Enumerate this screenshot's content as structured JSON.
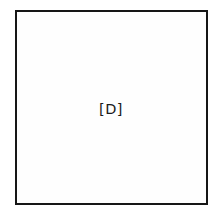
{
  "figure": {
    "placeholder_label": "[D]",
    "frame": {
      "border_color": "#161616",
      "fill_color": "#fefefe",
      "text_color": "#1b1b1b"
    }
  },
  "page": {
    "background_color": "#ffffff"
  }
}
